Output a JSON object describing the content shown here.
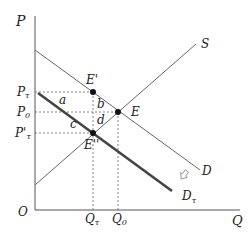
{
  "diagram": {
    "axes": {
      "y_label": "P",
      "x_label": "Q",
      "origin_label": "O"
    },
    "curves": [
      {
        "id": "S",
        "label": "S",
        "type": "supply"
      },
      {
        "id": "D",
        "label": "D",
        "type": "demand"
      },
      {
        "id": "Dt",
        "label": "D",
        "label_sub": "τ",
        "type": "demand-after-tax"
      }
    ],
    "points": [
      {
        "id": "E_prime",
        "label": "E'"
      },
      {
        "id": "E",
        "label": "E"
      },
      {
        "id": "E_dprime",
        "label": "E''"
      }
    ],
    "price_labels": {
      "pt": {
        "main": "P",
        "sub": "τ"
      },
      "p0": {
        "main": "P",
        "sub": "0"
      },
      "pt_prime": {
        "main": "P'",
        "sub": "τ"
      }
    },
    "quantity_labels": {
      "qt": {
        "main": "Q",
        "sub": "τ"
      },
      "q0": {
        "main": "Q",
        "sub": "0"
      }
    },
    "regions": {
      "a": "a",
      "b": "b",
      "c": "c",
      "d": "d"
    },
    "colors": {
      "axis": "#555555",
      "curve": "#555555",
      "tax_curve": "#444444",
      "point": "#111111",
      "dashed": "#666666"
    }
  }
}
